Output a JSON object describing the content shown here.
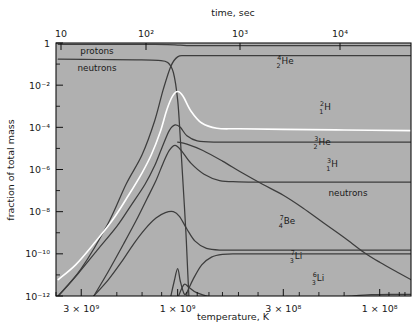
{
  "figure": {
    "top_axis_title": "time, sec",
    "bottom_axis_title": "temperature, K",
    "left_axis_title": "fraction of total mass"
  },
  "chart_data": {
    "type": "line",
    "title": "",
    "subtitle": "",
    "xlabel": "temperature, K",
    "ylabel": "fraction of total mass",
    "x2label": "time, sec",
    "grid": false,
    "legend": "inline-annotations",
    "x_axis": {
      "label": "temperature, K",
      "scale": "log",
      "direction": "decreasing",
      "range": [
        4000000000.0,
        70000000.0
      ],
      "tick_labels": [
        "3 × 10⁹",
        "1 × 10⁹",
        "3 × 10⁸",
        "1 × 10⁸"
      ],
      "tick_values": [
        3000000000.0,
        1000000000.0,
        300000000.0,
        100000000.0
      ]
    },
    "x2_axis": {
      "label": "time, sec",
      "scale": "log",
      "direction": "increasing",
      "tick_labels": [
        "10",
        "10²",
        "10³",
        "10⁴"
      ],
      "tick_values": [
        10,
        100,
        1000,
        10000
      ]
    },
    "y_axis": {
      "label": "fraction of total mass",
      "scale": "log",
      "range": [
        1e-12,
        1
      ],
      "tick_labels": [
        "1",
        "10⁻²",
        "10⁻⁴",
        "10⁻⁶",
        "10⁻⁸",
        "10⁻¹⁰",
        "10⁻¹²"
      ],
      "tick_values": [
        1,
        0.01,
        0.0001,
        1e-06,
        1e-08,
        1e-10,
        1e-12
      ]
    },
    "annotations": [
      {
        "text": "protons",
        "x_px": 97,
        "y_px": 54
      },
      {
        "text": "neutrons",
        "x_px": 97,
        "y_px": 71
      },
      {
        "text": "neutrons",
        "x_px": 348,
        "y_px": 196
      },
      {
        "text": "4He",
        "sup": "4",
        "sub": "2",
        "body": "He",
        "x_px": 285,
        "y_px": 64
      },
      {
        "text": "2H",
        "sup": "2",
        "sub": "1",
        "body": "H",
        "x_px": 325,
        "y_px": 110
      },
      {
        "text": "3He",
        "sup": "3",
        "sub": "2",
        "body": "He",
        "x_px": 322,
        "y_px": 145
      },
      {
        "text": "3H",
        "sup": "3",
        "sub": "1",
        "body": "H",
        "x_px": 332,
        "y_px": 167
      },
      {
        "text": "7Be",
        "sup": "7",
        "sub": "4",
        "body": "Be",
        "x_px": 287,
        "y_px": 224
      },
      {
        "text": "7Li",
        "sup": "7",
        "sub": "3",
        "body": "Li",
        "x_px": 296,
        "y_px": 259
      },
      {
        "text": "6Li",
        "sup": "6",
        "sub": "3",
        "body": "Li",
        "x_px": 318,
        "y_px": 281
      }
    ],
    "series": [
      {
        "name": "protons",
        "color": "#3d3d3d",
        "note": "near unity, dips slightly after helium formation",
        "points": [
          [
            3900000000.0,
            0.85
          ],
          [
            2000000000.0,
            0.85
          ],
          [
            1350000000.0,
            0.85
          ],
          [
            1120000000.0,
            0.84
          ],
          [
            1000000000.0,
            0.8
          ],
          [
            900000000.0,
            0.76
          ],
          [
            700000000.0,
            0.75
          ],
          [
            300000000.0,
            0.75
          ],
          [
            100000000.0,
            0.75
          ],
          [
            70000000.0,
            0.75
          ]
        ]
      },
      {
        "name": "neutrons-early",
        "color": "#3d3d3d",
        "note": "free neutron fraction ~0.17 falling to destruction at T~1e9",
        "points": [
          [
            3900000000.0,
            0.17
          ],
          [
            2500000000.0,
            0.165
          ],
          [
            1600000000.0,
            0.16
          ],
          [
            1250000000.0,
            0.15
          ],
          [
            1120000000.0,
            0.12
          ],
          [
            1050000000.0,
            0.04
          ],
          [
            1000000000.0,
            0.002
          ],
          [
            970000000.0,
            3e-05
          ],
          [
            940000000.0,
            2e-07
          ],
          [
            910000000.0,
            1e-09
          ],
          [
            890000000.0,
            1e-11
          ],
          [
            880000000.0,
            1e-12
          ]
        ]
      },
      {
        "name": "He4",
        "color": "#3d3d3d",
        "note": "rises steeply to ~0.25 plateau",
        "points": [
          [
            3900000000.0,
            1e-12
          ],
          [
            3000000000.0,
            2e-11
          ],
          [
            2200000000.0,
            3e-09
          ],
          [
            1800000000.0,
            2e-07
          ],
          [
            1500000000.0,
            5e-06
          ],
          [
            1300000000.0,
            0.0002
          ],
          [
            1180000000.0,
            0.006
          ],
          [
            1080000000.0,
            0.08
          ],
          [
            1000000000.0,
            0.22
          ],
          [
            900000000.0,
            0.25
          ],
          [
            600000000.0,
            0.25
          ],
          [
            300000000.0,
            0.25
          ],
          [
            100000000.0,
            0.25
          ],
          [
            70000000.0,
            0.25
          ]
        ]
      },
      {
        "name": "H2",
        "color": "#ffffff",
        "note": "deuterium, peaks ~5e-3 then falls to 8e-5 plateau",
        "points": [
          [
            3900000000.0,
            6e-12
          ],
          [
            3200000000.0,
            3e-11
          ],
          [
            2600000000.0,
            3e-10
          ],
          [
            2100000000.0,
            4e-09
          ],
          [
            1750000000.0,
            6e-08
          ],
          [
            1500000000.0,
            7e-07
          ],
          [
            1350000000.0,
            5e-06
          ],
          [
            1220000000.0,
            6e-05
          ],
          [
            1130000000.0,
            0.0007
          ],
          [
            1060000000.0,
            0.003
          ],
          [
            1000000000.0,
            0.005
          ],
          [
            940000000.0,
            0.003
          ],
          [
            860000000.0,
            0.0006
          ],
          [
            760000000.0,
            0.00016
          ],
          [
            640000000.0,
            9e-05
          ],
          [
            500000000.0,
            8.5e-05
          ],
          [
            300000000.0,
            8e-05
          ],
          [
            150000000.0,
            7.5e-05
          ],
          [
            70000000.0,
            7e-05
          ]
        ]
      },
      {
        "name": "He3",
        "color": "#3d3d3d",
        "note": "peaks ~1.3e-4 then settles at ~2e-5",
        "points": [
          [
            3900000000.0,
            1e-12
          ],
          [
            3100000000.0,
            1.2e-11
          ],
          [
            2500000000.0,
            1.5e-10
          ],
          [
            2000000000.0,
            2e-09
          ],
          [
            1700000000.0,
            2e-08
          ],
          [
            1450000000.0,
            2e-07
          ],
          [
            1300000000.0,
            1.5e-06
          ],
          [
            1200000000.0,
            1e-05
          ],
          [
            1100000000.0,
            7e-05
          ],
          [
            1030000000.0,
            0.00013
          ],
          [
            970000000.0,
            0.0001
          ],
          [
            900000000.0,
            4e-05
          ],
          [
            800000000.0,
            2.3e-05
          ],
          [
            650000000.0,
            2e-05
          ],
          [
            400000000.0,
            2e-05
          ],
          [
            200000000.0,
            2e-05
          ],
          [
            70000000.0,
            2e-05
          ]
        ]
      },
      {
        "name": "H3",
        "color": "#3d3d3d",
        "note": "tritium, rises to peak then decays to ~2.5e-7",
        "points": [
          [
            2600000000.0,
            1e-12
          ],
          [
            2200000000.0,
            1.5e-11
          ],
          [
            1850000000.0,
            3e-10
          ],
          [
            1600000000.0,
            4e-09
          ],
          [
            1420000000.0,
            4e-08
          ],
          [
            1280000000.0,
            3e-07
          ],
          [
            1180000000.0,
            2e-06
          ],
          [
            1100000000.0,
            8e-06
          ],
          [
            1030000000.0,
            1.4e-05
          ],
          [
            960000000.0,
            8e-06
          ],
          [
            860000000.0,
            2e-06
          ],
          [
            740000000.0,
            6e-07
          ],
          [
            620000000.0,
            3e-07
          ],
          [
            500000000.0,
            2.6e-07
          ],
          [
            300000000.0,
            2.5e-07
          ],
          [
            150000000.0,
            2.5e-07
          ],
          [
            70000000.0,
            2.5e-07
          ]
        ]
      },
      {
        "name": "neutrons-late",
        "color": "#3d3d3d",
        "note": "residual free neutrons decaying away at late times",
        "points": [
          [
            1000000000.0,
            2e-05
          ],
          [
            900000000.0,
            1.6e-05
          ],
          [
            750000000.0,
            8e-06
          ],
          [
            600000000.0,
            2.5e-06
          ],
          [
            480000000.0,
            7e-07
          ],
          [
            380000000.0,
            2e-07
          ],
          [
            300000000.0,
            6e-08
          ],
          [
            240000000.0,
            1.5e-08
          ],
          [
            190000000.0,
            3e-09
          ],
          [
            150000000.0,
            6e-10
          ],
          [
            120000000.0,
            1.2e-10
          ],
          [
            100000000.0,
            4e-11
          ],
          [
            80000000.0,
            1.2e-11
          ],
          [
            70000000.0,
            6e-12
          ]
        ]
      },
      {
        "name": "Be7",
        "color": "#3d3d3d",
        "note": "peaks ~1e-8 then dips and plateaus ~1.5e-10",
        "points": [
          [
            2600000000.0,
            1e-12
          ],
          [
            2200000000.0,
            6e-12
          ],
          [
            1900000000.0,
            4e-11
          ],
          [
            1650000000.0,
            3e-10
          ],
          [
            1450000000.0,
            1.5e-09
          ],
          [
            1280000000.0,
            5e-09
          ],
          [
            1150000000.0,
            9e-09
          ],
          [
            1050000000.0,
            1e-08
          ],
          [
            980000000.0,
            6e-09
          ],
          [
            900000000.0,
            1.5e-09
          ],
          [
            820000000.0,
            4e-10
          ],
          [
            720000000.0,
            1.8e-10
          ],
          [
            600000000.0,
            1.5e-10
          ],
          [
            400000000.0,
            1.5e-10
          ],
          [
            200000000.0,
            1.5e-10
          ],
          [
            70000000.0,
            1.5e-10
          ]
        ]
      },
      {
        "name": "Li7",
        "color": "#3d3d3d",
        "note": "small early spike then rise to ~1e-10 plateau",
        "points": [
          [
            1080000000.0,
            1e-12
          ],
          [
            1040000000.0,
            5e-12
          ],
          [
            1000000000.0,
            2e-11
          ],
          [
            970000000.0,
            5e-12
          ],
          [
            930000000.0,
            1.3e-12
          ],
          [
            900000000.0,
            1.5e-12
          ],
          [
            840000000.0,
            6e-12
          ],
          [
            760000000.0,
            3e-11
          ],
          [
            680000000.0,
            7e-11
          ],
          [
            600000000.0,
            9.5e-11
          ],
          [
            500000000.0,
            1e-10
          ],
          [
            300000000.0,
            1e-10
          ],
          [
            150000000.0,
            1e-10
          ],
          [
            70000000.0,
            1e-10
          ]
        ]
      },
      {
        "name": "Li6",
        "color": "#3d3d3d",
        "note": "tiny abundance, slowly rising toward ~1.2e-12",
        "points": [
          [
            990000000.0,
            1e-12
          ],
          [
            930000000.0,
            3.5e-12
          ],
          [
            880000000.0,
            2.6e-12
          ],
          [
            800000000.0,
            1.4e-12
          ],
          [
            650000000.0,
            8e-13
          ],
          [
            500000000.0,
            6e-13
          ],
          [
            360000000.0,
            5.5e-13
          ],
          [
            260000000.0,
            6e-13
          ],
          [
            190000000.0,
            8e-13
          ],
          [
            140000000.0,
            1e-12
          ],
          [
            110000000.0,
            1.15e-12
          ],
          [
            85000000.0,
            1.2e-12
          ],
          [
            70000000.0,
            1.2e-12
          ]
        ]
      }
    ]
  }
}
